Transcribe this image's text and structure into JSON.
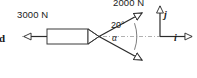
{
  "diagram": {
    "background_color": "#ffffff",
    "line_color": "#2b2b2b",
    "centerline_color": "#a8a8a8"
  },
  "labels": {
    "left_force": "3000 N",
    "upper_force": "2000 N",
    "upper_angle": "20°",
    "lower_angle": "α",
    "axis_i": "i",
    "axis_j": "j",
    "clipped_left_text": "d"
  },
  "forces": [
    {
      "name": "left-force",
      "magnitude": "3000 N",
      "direction": "left along rod axis",
      "angle_deg": 180
    },
    {
      "name": "upper-cable-force",
      "magnitude": "2000 N",
      "direction": "up and to the right",
      "angle_deg": 20
    },
    {
      "name": "lower-cable-force",
      "magnitude": "",
      "direction": "down and to the right",
      "angle_deg": -20
    }
  ],
  "axes": {
    "horizontal": {
      "label": "i",
      "direction": "right"
    },
    "vertical": {
      "label": "j",
      "direction": "up"
    },
    "origin_note": "axes drawn at right side of diagram"
  },
  "elements": {
    "rod": "horizontal rectangular bar with dash-dot centerline",
    "vertex": "junction where rod meets both cables",
    "angle_arc": "arc spanning from upper cable to lower cable through horizontal"
  }
}
